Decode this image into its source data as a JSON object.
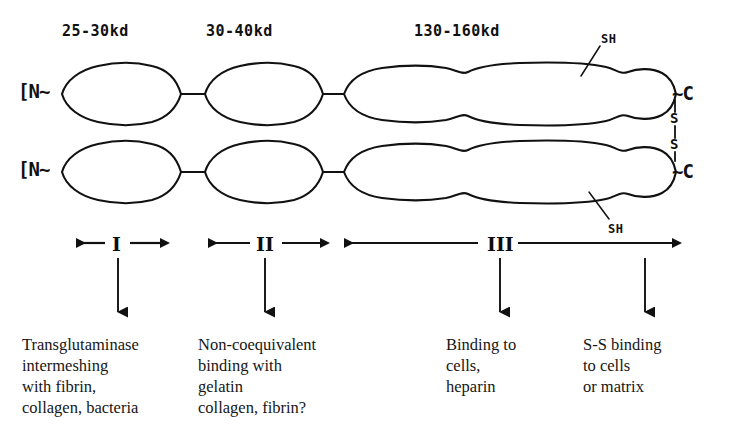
{
  "figure": {
    "background_color": "#ffffff",
    "ink_color": "#111111"
  },
  "mass_labels": [
    {
      "text": "25-30kd",
      "x": 62,
      "y": 22
    },
    {
      "text": "30-40kd",
      "x": 206,
      "y": 22
    },
    {
      "text": "130-160kd",
      "x": 414,
      "y": 22
    }
  ],
  "termini": {
    "upper_n": {
      "text": "[N~",
      "x": 18,
      "y": 80
    },
    "lower_n": {
      "text": "[N~",
      "x": 18,
      "y": 158
    },
    "upper_c": {
      "text": "~C",
      "x": 672,
      "y": 82
    },
    "lower_c": {
      "text": "~C",
      "x": 672,
      "y": 160
    }
  },
  "disulfide": {
    "upper_s": "S",
    "lower_s": "S",
    "note": "S-S interchain disulfide bridge near C-termini"
  },
  "sh_labels": [
    {
      "text": "SH",
      "x": 601,
      "y": 32,
      "anchor": "upper-chain"
    },
    {
      "text": "SH",
      "x": 608,
      "y": 222,
      "anchor": "lower-chain"
    }
  ],
  "domains": [
    {
      "numeral": "I",
      "x": 112,
      "y": 233,
      "arrow_x": 118
    },
    {
      "numeral": "II",
      "x": 256,
      "y": 233,
      "arrow_x": 265
    },
    {
      "numeral": "III",
      "x": 487,
      "y": 233,
      "arrow_x": 500
    },
    {
      "numeral": "",
      "x": 0,
      "y": 0,
      "arrow_x": 645
    }
  ],
  "captions": [
    {
      "lines": "Transglutaminase\nintermeshing\nwith fibrin,\ncollagen, bacteria",
      "x": 22,
      "y": 334
    },
    {
      "lines": "Non-coequivalent\nbinding with\ngelatin\ncollagen, fibrin?",
      "x": 198,
      "y": 334
    },
    {
      "lines": "Binding to\ncells,\nheparin",
      "x": 446,
      "y": 334
    },
    {
      "lines": "S-S binding\nto cells\nor matrix",
      "x": 583,
      "y": 334
    }
  ]
}
